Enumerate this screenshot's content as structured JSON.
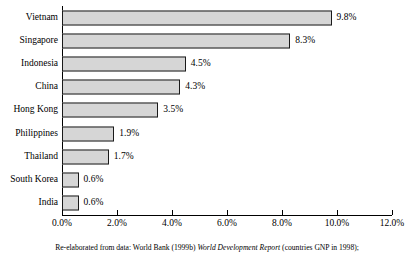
{
  "chart_data": {
    "type": "bar",
    "orientation": "horizontal",
    "title": "",
    "xlabel": "",
    "ylabel": "",
    "xlim": [
      0,
      12
    ],
    "grid": false,
    "legend": false,
    "categories": [
      "Vietnam",
      "Singapore",
      "Indonesia",
      "China",
      "Hong Kong",
      "Philippines",
      "Thailand",
      "South Korea",
      "India"
    ],
    "values": [
      9.8,
      8.3,
      4.5,
      4.3,
      3.5,
      1.9,
      1.7,
      0.6,
      0.6
    ],
    "value_labels": [
      "9.8%",
      "8.3%",
      "4.5%",
      "4.3%",
      "3.5%",
      "1.9%",
      "1.7%",
      "0.6%",
      "0.6%"
    ],
    "xticks": [
      0,
      2,
      4,
      6,
      8,
      10,
      12
    ],
    "xtick_labels": [
      "0.0%",
      "2.0%",
      "4.0%",
      "6.0%",
      "8.0%",
      "10.0%",
      "12.0%"
    ],
    "bar_fill_color": "#d6d6d6",
    "bar_border_color": "#1a1a1a",
    "axis_color": "#000000"
  },
  "caption": {
    "part1": "Re-elaborated from data: World Bank (1999b) ",
    "italic": "World Development Report",
    "part2": " (countries GNP in 1998);"
  }
}
